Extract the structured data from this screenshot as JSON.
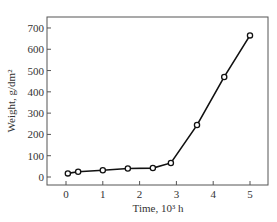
{
  "chart_data": {
    "type": "line",
    "title": "",
    "xlabel": "Time, 10³ h",
    "ylabel": "Weight, g/dm²",
    "xlim": [
      -0.5,
      5.5
    ],
    "ylim": [
      -50,
      750
    ],
    "xticks": [
      0,
      1,
      2,
      3,
      4,
      5
    ],
    "yticks": [
      0,
      100,
      200,
      300,
      400,
      500,
      600,
      700
    ],
    "grid": false,
    "legend": null,
    "series": [
      {
        "name": "Weight",
        "marker": "open-circle",
        "x": [
          0.05,
          0.33,
          1.0,
          1.68,
          2.36,
          2.85,
          3.56,
          4.3,
          5.0
        ],
        "y": [
          17,
          25,
          32,
          40,
          42,
          66,
          244,
          470,
          665
        ]
      }
    ]
  },
  "labels": {
    "xlabel": "Time, 10³ h",
    "ylabel": "Weight, g/dm²"
  }
}
